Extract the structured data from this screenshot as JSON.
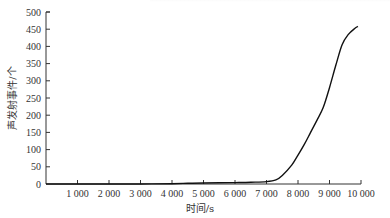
{
  "chart_data": {
    "type": "line",
    "title": "",
    "xlabel": "时间/s",
    "ylabel": "声发射事件/个",
    "xlim": [
      0,
      10000
    ],
    "ylim": [
      0,
      500
    ],
    "grid": false,
    "legend": null,
    "x_ticks": [
      1000,
      2000,
      3000,
      4000,
      5000,
      6000,
      7000,
      8000,
      9000,
      10000
    ],
    "x_tick_labels": [
      "1 000",
      "2 000",
      "3 000",
      "4 000",
      "5 000",
      "6 000",
      "7 000",
      "8 000",
      "9 000",
      "10 000"
    ],
    "y_ticks": [
      0,
      50,
      100,
      150,
      200,
      250,
      300,
      350,
      400,
      450,
      500
    ],
    "y_tick_labels": [
      "0",
      "50",
      "100",
      "150",
      "200",
      "250",
      "300",
      "350",
      "400",
      "450",
      "500"
    ],
    "series": [
      {
        "name": "声发射事件",
        "color": "#111111",
        "x": [
          0,
          1000,
          2000,
          3000,
          4000,
          4500,
          5000,
          6000,
          6500,
          7000,
          7300,
          7500,
          7800,
          8000,
          8200,
          8400,
          8600,
          8800,
          9000,
          9200,
          9400,
          9600,
          9800,
          9900
        ],
        "y": [
          0,
          0,
          0,
          0,
          1,
          2,
          3,
          4,
          5,
          7,
          12,
          25,
          55,
          84,
          115,
          150,
          185,
          222,
          280,
          345,
          405,
          435,
          452,
          458
        ]
      }
    ]
  }
}
